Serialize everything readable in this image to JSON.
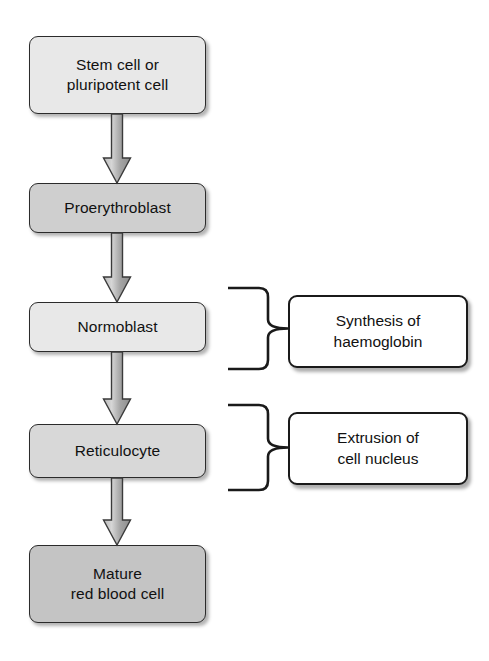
{
  "diagram": {
    "background_color": "#ffffff",
    "text_color": "#111111",
    "border_color": "#2b2b2b",
    "arrow_color": "#9a9a9a",
    "arrow_outline_color": "#3a3a3a"
  },
  "stages": [
    {
      "id": "stem-cell",
      "label": "Stem cell or\npluripotent cell",
      "fill": "#e8e8e8",
      "x": 29,
      "y": 36,
      "w": 177,
      "h": 78
    },
    {
      "id": "proerythroblast",
      "label": "Proerythroblast",
      "fill": "#cfcfcf",
      "x": 29,
      "y": 183,
      "w": 177,
      "h": 50
    },
    {
      "id": "normoblast",
      "label": "Normoblast",
      "fill": "#e8e8e8",
      "x": 29,
      "y": 302,
      "w": 177,
      "h": 50
    },
    {
      "id": "reticulocyte",
      "label": "Reticulocyte",
      "fill": "#d8d8d8",
      "x": 29,
      "y": 424,
      "w": 177,
      "h": 54
    },
    {
      "id": "mature-red-blood-cell",
      "label": "Mature\nred blood cell",
      "fill": "#c4c4c4",
      "x": 29,
      "y": 545,
      "w": 177,
      "h": 78
    }
  ],
  "arrows": [
    {
      "id": "arrow-stem-to-proerythroblast",
      "from": "stem-cell",
      "to": "proerythroblast",
      "x": 117,
      "y1": 114,
      "y2": 183
    },
    {
      "id": "arrow-proerythroblast-to-normoblast",
      "from": "proerythroblast",
      "to": "normoblast",
      "x": 117,
      "y1": 233,
      "y2": 302
    },
    {
      "id": "arrow-normoblast-to-reticulocyte",
      "from": "normoblast",
      "to": "reticulocyte",
      "x": 117,
      "y1": 352,
      "y2": 424
    },
    {
      "id": "arrow-reticulocyte-to-mature",
      "from": "reticulocyte",
      "to": "mature-red-blood-cell",
      "x": 117,
      "y1": 478,
      "y2": 545
    }
  ],
  "annotations": [
    {
      "id": "synthesis-of-haemoglobin",
      "label": "Synthesis of\nhaemoglobin",
      "box": {
        "x": 288,
        "y": 295,
        "w": 180,
        "h": 73
      },
      "brace": {
        "x_arm": 228,
        "x_spine": 268,
        "x_tip": 288,
        "y_top": 288,
        "y_bottom": 369
      }
    },
    {
      "id": "extrusion-of-cell-nucleus",
      "label": "Extrusion of\ncell nucleus",
      "box": {
        "x": 288,
        "y": 412,
        "w": 180,
        "h": 73
      },
      "brace": {
        "x_arm": 228,
        "x_spine": 268,
        "x_tip": 288,
        "y_top": 405,
        "y_bottom": 490
      }
    }
  ]
}
